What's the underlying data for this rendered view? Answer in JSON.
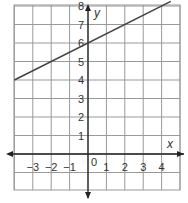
{
  "chart_data": {
    "type": "line",
    "title": "",
    "xlabel": "x",
    "ylabel": "y",
    "xlim": [
      -4,
      5
    ],
    "ylim": [
      -1,
      9
    ],
    "grid": true,
    "x_ticks": [
      "-3",
      "-2",
      "-1",
      "0",
      "1",
      "2",
      "3",
      "4"
    ],
    "y_ticks": [
      "1",
      "2",
      "3",
      "4",
      "5",
      "6",
      "7",
      "8"
    ],
    "series": [
      {
        "name": "y = 0.5x + 6",
        "x": [
          -4,
          4.5
        ],
        "y": [
          4,
          8.25
        ]
      }
    ],
    "line_color": "#444444"
  }
}
